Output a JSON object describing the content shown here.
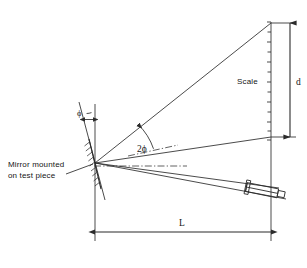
{
  "figure": {
    "type": "technical-line-diagram",
    "background_color": "#ffffff",
    "line_color": "#2b2b2b"
  },
  "labels": {
    "mirror_line1": "Mirror mounted",
    "mirror_line2": "on test piece",
    "scale": "Scale",
    "distance_d": "d",
    "distance_L": "L",
    "angle_phi": "ϕ",
    "angle_two_phi": "2ϕ"
  },
  "geometry": {
    "mirror_pivot": {
      "x": 95,
      "y": 163
    },
    "vertical_reference_line": {
      "x": 95,
      "y_top": 104,
      "y_bottom": 241
    },
    "scale_line": {
      "x": 271,
      "y_top": 22,
      "y_bottom": 241
    },
    "scale_ticks": {
      "count": 13,
      "y_start": 22,
      "y_end": 140,
      "tick_length": 4,
      "side": "left"
    },
    "rays": [
      {
        "name": "deflected-ray-upper",
        "from": [
          95,
          163
        ],
        "to": [
          271,
          23
        ]
      },
      {
        "name": "incident-reflected-ray-middle",
        "from": [
          95,
          163
        ],
        "to": [
          271,
          137
        ]
      },
      {
        "name": "sight-ray-lower",
        "from": [
          95,
          163
        ],
        "to": [
          284,
          198
        ]
      },
      {
        "name": "sight-ray-lower-2",
        "from": [
          95,
          163
        ],
        "to": [
          282,
          191
        ]
      }
    ],
    "centerline_dashdot": {
      "from": [
        93,
        166
      ],
      "to": [
        186,
        166
      ]
    },
    "angle_arc_two_phi": {
      "vertex": [
        95,
        163
      ],
      "radius": 62,
      "label_at": [
        143,
        147
      ]
    },
    "angle_arc_phi": {
      "vertex": [
        85,
        110
      ],
      "label_at": [
        79,
        116
      ]
    },
    "mirror_plate": {
      "from": [
        90,
        140
      ],
      "to": [
        100,
        190
      ],
      "hatch_count": 9
    },
    "mirror_normal_line": {
      "from": [
        78,
        103
      ],
      "to": [
        104,
        200
      ]
    },
    "telescope": {
      "center": [
        268,
        192
      ],
      "angle_deg": 12,
      "barrel_length": 40,
      "barrel_height": 9,
      "eyepiece_length": 7
    },
    "dimension_L": {
      "y": 232,
      "x_start": 95,
      "x_end": 271,
      "label_at": [
        183,
        226
      ]
    },
    "dimension_d": {
      "x": 290,
      "y_start": 23,
      "y_end": 137,
      "label_at": [
        296,
        84
      ]
    },
    "extension_lines": [
      {
        "name": "d-upper-extension",
        "from": [
          271,
          23
        ],
        "to": [
          295,
          23
        ]
      },
      {
        "name": "d-lower-extension",
        "from": [
          271,
          137
        ],
        "to": [
          295,
          137
        ]
      }
    ],
    "leader_line_mirror_label": {
      "from": [
        68,
        173
      ],
      "to": [
        92,
        164
      ]
    }
  }
}
